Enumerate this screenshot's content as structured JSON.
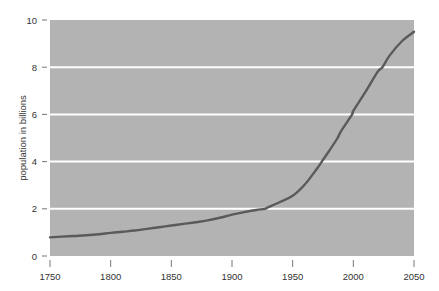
{
  "chart_data": {
    "type": "line",
    "title": "",
    "subtitle": "",
    "xlabel": "",
    "ylabel": "population in billions",
    "xlim": [
      1750,
      2050
    ],
    "ylim": [
      0,
      10
    ],
    "grid": "horizontal",
    "legend": "none",
    "xticks": [
      "1750",
      "1800",
      "1850",
      "1900",
      "1950",
      "2000",
      "2050"
    ],
    "xtick_values": [
      1750,
      1800,
      1850,
      1900,
      1950,
      2000,
      2050
    ],
    "yticks": [
      "0",
      "2",
      "4",
      "6",
      "8",
      "10"
    ],
    "ytick_values": [
      0,
      2,
      4,
      6,
      8,
      10
    ],
    "gridline_values": [
      2,
      4,
      6,
      8
    ],
    "series": [
      {
        "name": "world population",
        "x": [
          1750,
          1760,
          1770,
          1780,
          1790,
          1800,
          1810,
          1820,
          1830,
          1840,
          1850,
          1860,
          1870,
          1880,
          1890,
          1900,
          1910,
          1920,
          1927,
          1930,
          1940,
          1950,
          1960,
          1970,
          1974,
          1980,
          1987,
          1990,
          1999,
          2000,
          2010,
          2020,
          2024,
          2030,
          2040,
          2050
        ],
        "values": [
          0.79,
          0.82,
          0.85,
          0.88,
          0.92,
          0.98,
          1.03,
          1.08,
          1.15,
          1.22,
          1.29,
          1.36,
          1.43,
          1.51,
          1.62,
          1.75,
          1.86,
          1.95,
          2.0,
          2.07,
          2.3,
          2.55,
          3.03,
          3.7,
          4.0,
          4.45,
          5.0,
          5.3,
          6.0,
          6.15,
          6.95,
          7.8,
          8.0,
          8.5,
          9.1,
          9.5
        ],
        "color": "#5a5a5a"
      }
    ],
    "colors": {
      "plot_background": "#b3b3b3",
      "gridline": "#ffffff",
      "line": "#5a5a5a",
      "axis_text": "#333333",
      "page_background": "#ffffff"
    }
  }
}
